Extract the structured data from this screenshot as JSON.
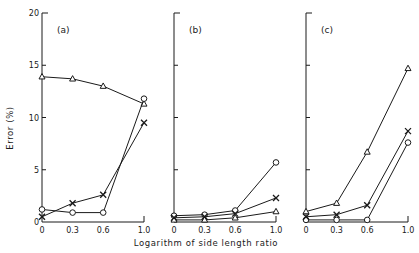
{
  "figure": {
    "xlabel": "Logarithm of side length ratio",
    "ylabel": "Error (%)",
    "line_color": "#1a1a1a",
    "background": "#ffffff"
  },
  "chart_data": [
    {
      "type": "line",
      "panel": "(a)",
      "title": "(a)",
      "x": [
        0,
        0.3,
        0.6,
        1.0
      ],
      "x_tick_labels": [
        "0",
        "0.3",
        "0.6",
        "1.0"
      ],
      "y_tick_labels": [
        "0",
        "5",
        "10",
        "15",
        "20"
      ],
      "ylim": [
        0,
        20
      ],
      "xlim": [
        0,
        1.0
      ],
      "xlabel": "Logarithm of side length ratio",
      "ylabel": "Error (%)",
      "grid": false,
      "series": [
        {
          "name": "triangle",
          "marker": "triangle",
          "values": [
            13.9,
            13.7,
            13.0,
            11.3
          ]
        },
        {
          "name": "circle",
          "marker": "circle",
          "values": [
            1.2,
            0.9,
            0.9,
            11.8
          ]
        },
        {
          "name": "cross",
          "marker": "x",
          "values": [
            0.5,
            1.8,
            2.6,
            9.5
          ]
        }
      ]
    },
    {
      "type": "line",
      "panel": "(b)",
      "title": "(b)",
      "x": [
        0,
        0.3,
        0.6,
        1.0
      ],
      "x_tick_labels": [
        "0",
        "0.3",
        "0.6",
        "1.0"
      ],
      "ylim": [
        0,
        20
      ],
      "xlim": [
        0,
        1.0
      ],
      "grid": false,
      "series": [
        {
          "name": "triangle",
          "marker": "triangle",
          "values": [
            0.2,
            0.2,
            0.4,
            1.0
          ]
        },
        {
          "name": "circle",
          "marker": "circle",
          "values": [
            0.6,
            0.7,
            1.1,
            5.7
          ]
        },
        {
          "name": "cross",
          "marker": "x",
          "values": [
            0.4,
            0.5,
            0.8,
            2.3
          ]
        }
      ]
    },
    {
      "type": "line",
      "panel": "(c)",
      "title": "(c)",
      "x": [
        0,
        0.3,
        0.6,
        1.0
      ],
      "x_tick_labels": [
        "0",
        "0.3",
        "0.6",
        "1.0"
      ],
      "ylim": [
        0,
        20
      ],
      "xlim": [
        0,
        1.0
      ],
      "grid": false,
      "series": [
        {
          "name": "triangle",
          "marker": "triangle",
          "values": [
            1.0,
            1.8,
            6.7,
            14.7
          ]
        },
        {
          "name": "circle",
          "marker": "circle",
          "values": [
            0.2,
            0.2,
            0.2,
            7.6
          ]
        },
        {
          "name": "cross",
          "marker": "x",
          "values": [
            0.5,
            0.7,
            1.6,
            8.7
          ]
        }
      ]
    }
  ]
}
